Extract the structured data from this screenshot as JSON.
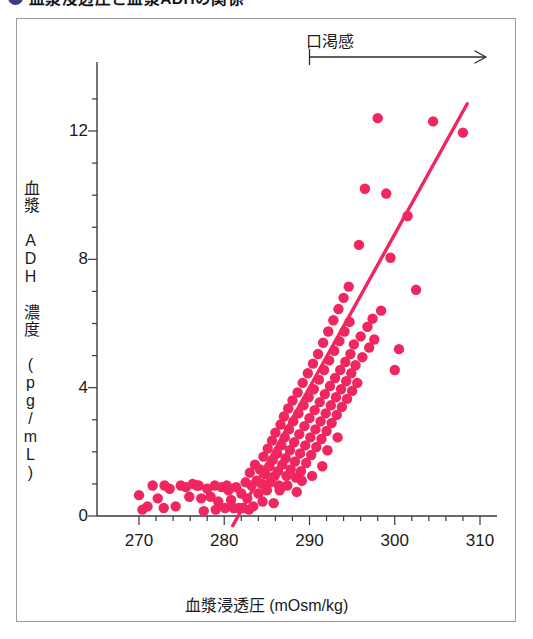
{
  "figure": {
    "bullet_color": "#3b3f7a",
    "title": "血漿浸透圧と血漿ADHの関係"
  },
  "annotation": {
    "label": "口渇感",
    "arrow_start_x": 290,
    "arrow_end_x": 310
  },
  "axes": {
    "x_title": "血漿浸透圧 (mOsm/kg)",
    "y_title": "血漿 ADH 濃度 (pg/mL)",
    "x_ticks": [
      "270",
      "280",
      "290",
      "300",
      "310"
    ],
    "y_ticks": [
      "0",
      "4",
      "8",
      "12"
    ]
  },
  "chart_data": {
    "type": "scatter",
    "title": "血漿浸透圧と血漿ADHの関係",
    "xlabel": "血漿浸透圧 (mOsm/kg)",
    "ylabel": "血漿 ADH 濃度 (pg/mL)",
    "xlim": [
      266.5,
      312.5
    ],
    "ylim": [
      -0.55,
      13.6
    ],
    "x_ticks": [
      270,
      280,
      290,
      300,
      310
    ],
    "y_ticks": [
      0,
      4,
      8,
      12
    ],
    "x_minor_step": 2,
    "y_minor_step": 1,
    "grid": false,
    "legend": null,
    "point_color": "#f0265e",
    "line_color": "#f0265e",
    "point_radius_px": 5.2,
    "annotations": [
      {
        "text": "口渇感",
        "x_start": 290,
        "x_end": 310,
        "y": 13.3,
        "style": "arrow-right"
      }
    ],
    "series": [
      {
        "name": "血漿ADH濃度",
        "type": "scatter",
        "points": [
          [
            270.0,
            0.65
          ],
          [
            270.4,
            0.2
          ],
          [
            271.6,
            0.95
          ],
          [
            272.2,
            0.55
          ],
          [
            272.9,
            0.25
          ],
          [
            273.6,
            0.85
          ],
          [
            274.3,
            0.3
          ],
          [
            274.9,
            0.95
          ],
          [
            275.5,
            0.9
          ],
          [
            275.9,
            0.6
          ],
          [
            276.3,
            1.0
          ],
          [
            276.8,
            0.95
          ],
          [
            277.3,
            0.55
          ],
          [
            277.6,
            0.15
          ],
          [
            278.0,
            0.85
          ],
          [
            278.4,
            0.6
          ],
          [
            278.9,
            0.95
          ],
          [
            279.3,
            0.45
          ],
          [
            279.7,
            0.9
          ],
          [
            280.1,
            0.25
          ],
          [
            280.5,
            0.8
          ],
          [
            280.8,
            0.5
          ],
          [
            281.1,
            0.25
          ],
          [
            281.4,
            0.9
          ],
          [
            281.7,
            0.25
          ],
          [
            282.0,
            0.7
          ],
          [
            282.2,
            0.25
          ],
          [
            282.5,
            1.05
          ],
          [
            282.7,
            0.55
          ],
          [
            283.0,
            1.35
          ],
          [
            283.2,
            0.95
          ],
          [
            283.4,
            0.3
          ],
          [
            283.6,
            1.6
          ],
          [
            283.8,
            1.1
          ],
          [
            284.0,
            0.7
          ],
          [
            284.2,
            1.45
          ],
          [
            284.4,
            1.0
          ],
          [
            284.6,
            1.85
          ],
          [
            284.8,
            1.3
          ],
          [
            285.0,
            0.8
          ],
          [
            285.1,
            2.1
          ],
          [
            285.3,
            1.55
          ],
          [
            285.4,
            1.05
          ],
          [
            285.6,
            2.35
          ],
          [
            285.7,
            1.75
          ],
          [
            285.9,
            1.25
          ],
          [
            286.0,
            2.6
          ],
          [
            286.2,
            1.95
          ],
          [
            286.3,
            1.4
          ],
          [
            286.4,
            0.95
          ],
          [
            286.6,
            2.85
          ],
          [
            286.7,
            2.2
          ],
          [
            286.8,
            1.6
          ],
          [
            287.0,
            3.1
          ],
          [
            287.1,
            2.45
          ],
          [
            287.2,
            1.8
          ],
          [
            287.3,
            1.25
          ],
          [
            287.5,
            3.35
          ],
          [
            287.6,
            2.7
          ],
          [
            287.7,
            2.05
          ],
          [
            287.8,
            1.45
          ],
          [
            288.0,
            3.6
          ],
          [
            288.1,
            2.95
          ],
          [
            288.2,
            2.3
          ],
          [
            288.3,
            1.7
          ],
          [
            288.4,
            1.2
          ],
          [
            288.6,
            3.85
          ],
          [
            288.7,
            3.2
          ],
          [
            288.8,
            2.55
          ],
          [
            288.9,
            1.95
          ],
          [
            289.0,
            1.4
          ],
          [
            289.2,
            4.15
          ],
          [
            289.3,
            3.45
          ],
          [
            289.4,
            2.8
          ],
          [
            289.5,
            2.2
          ],
          [
            289.6,
            1.65
          ],
          [
            289.8,
            4.45
          ],
          [
            289.9,
            3.7
          ],
          [
            290.0,
            3.05
          ],
          [
            290.1,
            2.45
          ],
          [
            290.2,
            1.9
          ],
          [
            290.4,
            4.75
          ],
          [
            290.5,
            3.95
          ],
          [
            290.6,
            3.3
          ],
          [
            290.7,
            2.7
          ],
          [
            290.8,
            2.15
          ],
          [
            291.0,
            5.05
          ],
          [
            291.1,
            4.25
          ],
          [
            291.2,
            3.55
          ],
          [
            291.3,
            2.95
          ],
          [
            291.4,
            2.4
          ],
          [
            291.6,
            5.4
          ],
          [
            291.7,
            4.55
          ],
          [
            291.8,
            3.8
          ],
          [
            291.9,
            3.2
          ],
          [
            292.0,
            2.65
          ],
          [
            292.2,
            5.75
          ],
          [
            292.3,
            4.85
          ],
          [
            292.4,
            4.05
          ],
          [
            292.5,
            3.45
          ],
          [
            292.6,
            2.9
          ],
          [
            292.8,
            6.1
          ],
          [
            292.9,
            5.15
          ],
          [
            293.0,
            4.3
          ],
          [
            293.1,
            3.7
          ],
          [
            293.2,
            3.15
          ],
          [
            293.4,
            6.45
          ],
          [
            293.5,
            5.45
          ],
          [
            293.6,
            4.55
          ],
          [
            293.7,
            3.95
          ],
          [
            293.8,
            3.4
          ],
          [
            294.0,
            6.8
          ],
          [
            294.1,
            5.75
          ],
          [
            294.2,
            4.8
          ],
          [
            294.3,
            4.2
          ],
          [
            294.4,
            3.65
          ],
          [
            294.6,
            7.15
          ],
          [
            294.7,
            6.05
          ],
          [
            294.8,
            5.05
          ],
          [
            294.9,
            4.45
          ],
          [
            295.0,
            3.9
          ],
          [
            295.2,
            5.35
          ],
          [
            295.4,
            4.7
          ],
          [
            295.6,
            4.15
          ],
          [
            295.8,
            8.45
          ],
          [
            296.0,
            5.6
          ],
          [
            296.2,
            4.95
          ],
          [
            296.5,
            10.2
          ],
          [
            296.8,
            5.9
          ],
          [
            297.0,
            5.25
          ],
          [
            297.4,
            6.15
          ],
          [
            297.6,
            5.5
          ],
          [
            298.0,
            12.4
          ],
          [
            298.4,
            6.4
          ],
          [
            299.0,
            10.05
          ],
          [
            299.5,
            8.05
          ],
          [
            300.0,
            4.55
          ],
          [
            300.5,
            5.2
          ],
          [
            301.5,
            9.35
          ],
          [
            302.5,
            7.05
          ],
          [
            304.5,
            12.3
          ],
          [
            308.0,
            11.95
          ],
          [
            286.5,
            0.8
          ],
          [
            287.4,
            0.95
          ],
          [
            288.5,
            0.75
          ],
          [
            289.1,
            1.1
          ],
          [
            290.3,
            1.25
          ],
          [
            291.5,
            1.55
          ],
          [
            292.1,
            2.05
          ],
          [
            293.3,
            2.45
          ],
          [
            284.5,
            0.45
          ],
          [
            285.8,
            0.4
          ],
          [
            282.9,
            0.2
          ],
          [
            280.3,
            0.95
          ],
          [
            273.0,
            0.95
          ],
          [
            271.0,
            0.3
          ],
          [
            279.0,
            0.2
          ],
          [
            277.0,
            0.95
          ]
        ]
      },
      {
        "name": "回帰直線",
        "type": "line",
        "points": [
          [
            281.0,
            -0.3
          ],
          [
            308.5,
            12.85
          ]
        ]
      }
    ]
  }
}
